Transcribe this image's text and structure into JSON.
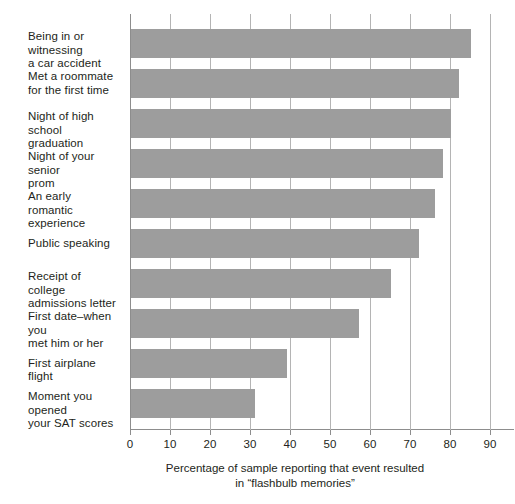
{
  "chart_data": {
    "type": "bar",
    "orientation": "horizontal",
    "title": "",
    "xlabel": "Percentage of sample reporting that event resulted in \"flashbulb memories\"",
    "ylabel": "",
    "xlim": [
      0,
      90
    ],
    "xticks": [
      0,
      10,
      20,
      30,
      40,
      50,
      60,
      70,
      80,
      90
    ],
    "grid": true,
    "grid_axis": "x",
    "legend": "none",
    "bar_color": "#9d9d9d",
    "axis_color": "#8d8d8d",
    "categories": [
      "Being in or witnessing a car accident",
      "Met a roommate for the first time",
      "Night of high school graduation",
      "Night of your senior prom",
      "An early romantic experience",
      "Public speaking",
      "Receipt of college admissions letter",
      "First date–when you met him or her",
      "First airplane flight",
      "Moment you opened your SAT scores"
    ],
    "values": [
      85,
      82,
      80,
      78,
      76,
      72,
      65,
      57,
      39,
      31
    ]
  },
  "labels": [
    {
      "line1": "Being in or witnessing",
      "line2": "a car accident"
    },
    {
      "line1": "Met a roommate",
      "line2": "for the first time"
    },
    {
      "line1": "Night of high school",
      "line2": "graduation"
    },
    {
      "line1": "Night of your senior",
      "line2": "prom"
    },
    {
      "line1": "An early romantic",
      "line2": "experience"
    },
    {
      "line1": "Public speaking",
      "line2": ""
    },
    {
      "line1": "Receipt of college",
      "line2": "admissions letter"
    },
    {
      "line1": "First date–when you",
      "line2": "met him or her"
    },
    {
      "line1": "First airplane flight",
      "line2": ""
    },
    {
      "line1": "Moment you opened",
      "line2": "your SAT scores"
    }
  ],
  "xaxis": {
    "ticks": [
      "0",
      "10",
      "20",
      "30",
      "40",
      "50",
      "60",
      "70",
      "80",
      "90"
    ]
  },
  "caption": {
    "line1": "Percentage of sample reporting that event resulted",
    "line2": "in “flashbulb memories”"
  }
}
